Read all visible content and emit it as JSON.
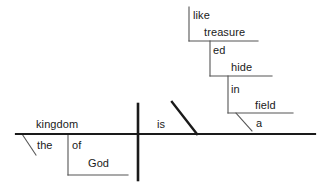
{
  "diagram": {
    "type": "reed-kellogg-sentence-diagram",
    "sentence": "The kingdom of God is like treasure hidden in a field",
    "colors": {
      "background": "#ffffff",
      "ink": "#1a1a1a",
      "thin_line": "#555555"
    },
    "baseline": {
      "label": "main-baseline",
      "x1": 16,
      "y1": 134,
      "x2": 315,
      "y2": 134,
      "width": 2.2
    },
    "divider": {
      "label": "subject-predicate-divider",
      "x1": 138,
      "y1": 104,
      "x2": 138,
      "y2": 180,
      "width": 2.6
    },
    "complement_slant": {
      "label": "predicate-complement-slant",
      "x1": 172,
      "y1": 102,
      "x2": 197,
      "y2": 134,
      "width": 2.4
    },
    "words": [
      {
        "name": "word-kingdom",
        "text": "kingdom",
        "x": 36,
        "y": 119,
        "role": "subject"
      },
      {
        "name": "word-the",
        "text": "the",
        "x": 37,
        "y": 140,
        "role": "article-modifier"
      },
      {
        "name": "word-of",
        "text": "of",
        "x": 72,
        "y": 140,
        "role": "preposition"
      },
      {
        "name": "word-god",
        "text": "God",
        "x": 88,
        "y": 158,
        "role": "object-of-preposition"
      },
      {
        "name": "word-is",
        "text": "is",
        "x": 157,
        "y": 119,
        "role": "linking-verb"
      },
      {
        "name": "word-like",
        "text": "like",
        "x": 193,
        "y": 10,
        "role": "preposition"
      },
      {
        "name": "word-treasure",
        "text": "treasure",
        "x": 204,
        "y": 27,
        "role": "object-of-preposition"
      },
      {
        "name": "word-ed",
        "text": "ed",
        "x": 213,
        "y": 45,
        "role": "participle-suffix"
      },
      {
        "name": "word-hide",
        "text": "hide",
        "x": 231,
        "y": 62,
        "role": "participle-stem"
      },
      {
        "name": "word-in",
        "text": "in",
        "x": 231,
        "y": 84,
        "role": "preposition"
      },
      {
        "name": "word-field",
        "text": "field",
        "x": 255,
        "y": 100,
        "role": "object-of-preposition"
      },
      {
        "name": "word-a",
        "text": "a",
        "x": 256,
        "y": 118,
        "role": "article-modifier"
      }
    ],
    "lines": [
      {
        "name": "line-the-slant",
        "x1": 22,
        "y1": 134,
        "x2": 36,
        "y2": 155,
        "width": 1.1
      },
      {
        "name": "line-of-vertical",
        "x1": 68,
        "y1": 134,
        "x2": 68,
        "y2": 175,
        "width": 1.1
      },
      {
        "name": "line-god-horizontal",
        "x1": 68,
        "y1": 175,
        "x2": 128,
        "y2": 175,
        "width": 1.1
      },
      {
        "name": "line-like-vertical",
        "x1": 189,
        "y1": 7,
        "x2": 189,
        "y2": 41,
        "width": 1.1
      },
      {
        "name": "line-treasure-horizontal",
        "x1": 189,
        "y1": 41,
        "x2": 258,
        "y2": 41,
        "width": 1.1
      },
      {
        "name": "line-ed-vertical",
        "x1": 210,
        "y1": 41,
        "x2": 210,
        "y2": 76,
        "width": 1.1
      },
      {
        "name": "line-hide-horizontal",
        "x1": 210,
        "y1": 76,
        "x2": 272,
        "y2": 76,
        "width": 1.1
      },
      {
        "name": "line-in-vertical",
        "x1": 228,
        "y1": 76,
        "x2": 228,
        "y2": 113,
        "width": 1.1
      },
      {
        "name": "line-field-horizontal",
        "x1": 228,
        "y1": 113,
        "x2": 293,
        "y2": 113,
        "width": 1.1
      },
      {
        "name": "line-a-slant",
        "x1": 236,
        "y1": 113,
        "x2": 252,
        "y2": 131,
        "width": 1.1
      }
    ]
  }
}
